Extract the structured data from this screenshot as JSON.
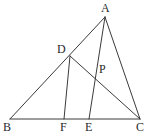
{
  "figure": {
    "kind": "euclidean-geometry-diagram",
    "canvas": {
      "width": 154,
      "height": 136
    },
    "stroke_color": "#3a3a3a",
    "label_color": "#2b2b2b",
    "background_color": "#ffffff",
    "stroke_width": 1
  },
  "points": [
    {
      "id": "A",
      "label": "A",
      "x": 105,
      "y": 17,
      "label_x": 101,
      "label_y": 2,
      "role": "apex-vertex"
    },
    {
      "id": "B",
      "label": "B",
      "x": 10,
      "y": 119,
      "label_x": 3,
      "label_y": 121,
      "role": "base-vertex-left"
    },
    {
      "id": "C",
      "label": "C",
      "x": 140,
      "y": 119,
      "label_x": 136,
      "label_y": 121,
      "role": "base-vertex-right"
    },
    {
      "id": "D",
      "label": "D",
      "x": 70,
      "y": 56,
      "label_x": 57,
      "label_y": 43,
      "role": "point-on-AB"
    },
    {
      "id": "P",
      "label": "P",
      "x": 97,
      "y": 76,
      "label_x": 99,
      "label_y": 63,
      "role": "intersection-DC-AE"
    },
    {
      "id": "F",
      "label": "F",
      "x": 64,
      "y": 119,
      "label_x": 60,
      "label_y": 121,
      "role": "point-on-BC"
    },
    {
      "id": "E",
      "label": "E",
      "x": 89,
      "y": 119,
      "label_x": 85,
      "label_y": 121,
      "role": "point-on-BC"
    }
  ],
  "segments": [
    {
      "id": "AB",
      "from": "A",
      "to": "B",
      "name": "side-ab"
    },
    {
      "id": "AC",
      "from": "A",
      "to": "C",
      "name": "side-ac"
    },
    {
      "id": "BC",
      "from": "B",
      "to": "C",
      "name": "side-bc"
    },
    {
      "id": "DF",
      "from": "D",
      "to": "F",
      "name": "segment-df"
    },
    {
      "id": "DC",
      "from": "D",
      "to": "C",
      "name": "cevian-dc"
    },
    {
      "id": "AE",
      "from": "A",
      "to": "E",
      "name": "cevian-ae"
    }
  ]
}
